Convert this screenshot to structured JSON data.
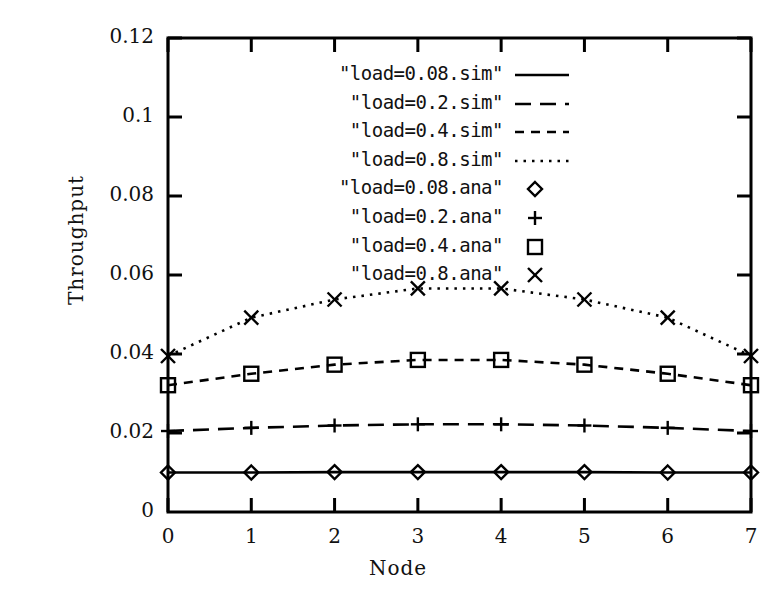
{
  "chart_data": {
    "type": "line",
    "title": "",
    "xlabel": "Node",
    "ylabel": "Throughput",
    "x": [
      0,
      1,
      2,
      3,
      4,
      5,
      6,
      7
    ],
    "xlim": [
      0,
      7
    ],
    "ylim": [
      0,
      0.12
    ],
    "xticks": [
      "0",
      "1",
      "2",
      "3",
      "4",
      "5",
      "6",
      "7"
    ],
    "yticks": [
      "0",
      "0.02",
      "0.04",
      "0.06",
      "0.08",
      "0.1",
      "0.12"
    ],
    "ytick_values": [
      0,
      0.02,
      0.04,
      0.06,
      0.08,
      0.1,
      0.12
    ],
    "grid": false,
    "legend_position": "inside-top-right",
    "series": [
      {
        "name": "\"load=0.08.sim\"",
        "style": "solid-line",
        "marker": "none",
        "values": [
          0.01,
          0.01,
          0.0101,
          0.0101,
          0.0101,
          0.0101,
          0.01,
          0.01
        ]
      },
      {
        "name": "\"load=0.2.sim\"",
        "style": "long-dash-line",
        "marker": "none",
        "values": [
          0.0205,
          0.0213,
          0.0219,
          0.0222,
          0.0222,
          0.0219,
          0.0213,
          0.0205
        ]
      },
      {
        "name": "\"load=0.4.sim\"",
        "style": "short-dash-line",
        "marker": "none",
        "values": [
          0.0321,
          0.035,
          0.0373,
          0.0385,
          0.0385,
          0.0373,
          0.035,
          0.0321
        ]
      },
      {
        "name": "\"load=0.8.sim\"",
        "style": "dotted-line",
        "marker": "none",
        "values": [
          0.0395,
          0.0492,
          0.0538,
          0.0566,
          0.0566,
          0.0538,
          0.0492,
          0.0395
        ]
      },
      {
        "name": "\"load=0.08.ana\"",
        "style": "markers-only",
        "marker": "diamond",
        "values": [
          0.01,
          0.01,
          0.0101,
          0.0101,
          0.0101,
          0.0101,
          0.01,
          0.01
        ]
      },
      {
        "name": "\"load=0.2.ana\"",
        "style": "markers-only",
        "marker": "plus",
        "values": [
          0.0205,
          0.0213,
          0.0219,
          0.0222,
          0.0222,
          0.0219,
          0.0213,
          0.0205
        ]
      },
      {
        "name": "\"load=0.4.ana\"",
        "style": "markers-only",
        "marker": "square",
        "values": [
          0.0321,
          0.035,
          0.0373,
          0.0385,
          0.0385,
          0.0373,
          0.035,
          0.0321
        ]
      },
      {
        "name": "\"load=0.8.ana\"",
        "style": "markers-only",
        "marker": "cross",
        "values": [
          0.0395,
          0.0492,
          0.0538,
          0.0566,
          0.0566,
          0.0538,
          0.0492,
          0.0395
        ]
      }
    ],
    "colors": {
      "line": "#000000",
      "axis": "#000000",
      "background": "#ffffff"
    }
  }
}
